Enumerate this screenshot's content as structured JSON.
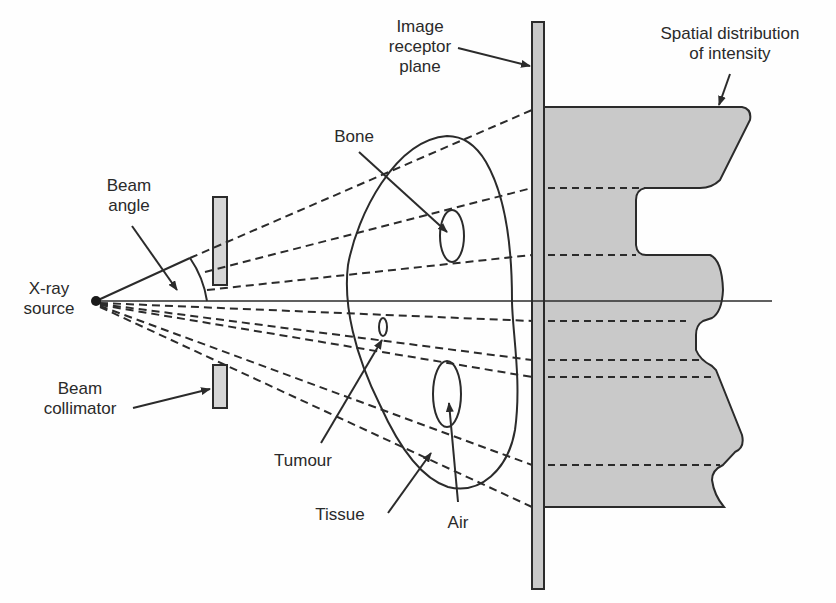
{
  "diagram": {
    "type": "x-ray projection schematic",
    "labels": {
      "xray_source": [
        "X-ray",
        "source"
      ],
      "beam_angle": [
        "Beam",
        "angle"
      ],
      "beam_collimator": [
        "Beam",
        "collimator"
      ],
      "bone": "Bone",
      "tumour": "Tumour",
      "tissue": "Tissue",
      "air": "Air",
      "image_receptor": [
        "Image",
        "receptor",
        "plane"
      ],
      "spatial_distribution": [
        "Spatial distribution",
        "of intensity"
      ]
    },
    "colors": {
      "line": "#2b2b2b",
      "fill_gray": "#c9c9c9",
      "background": "#fefefe"
    }
  }
}
